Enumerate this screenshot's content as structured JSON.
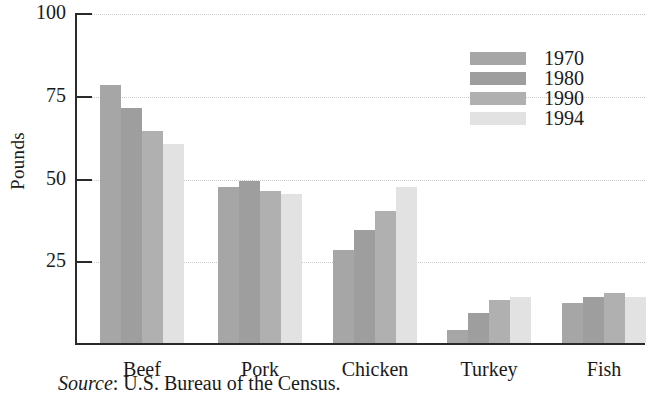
{
  "chart_data": {
    "type": "bar",
    "title": "",
    "xlabel": "",
    "ylabel": "Pounds",
    "ylim": [
      0,
      100
    ],
    "yticks": [
      25,
      50,
      75,
      100
    ],
    "ytick_labels": [
      "25",
      "50",
      "75",
      "100"
    ],
    "grid": true,
    "legend_position": "top-right",
    "categories": [
      "Beef",
      "Pork",
      "Chicken",
      "Turkey",
      "Fish"
    ],
    "series": [
      {
        "name": "1970",
        "color": "#a6a6a6",
        "values": [
          78,
          47,
          28,
          4,
          12
        ]
      },
      {
        "name": "1980",
        "color": "#9e9e9e",
        "values": [
          71,
          49,
          34,
          9,
          14
        ]
      },
      {
        "name": "1990",
        "color": "#b0b0b0",
        "values": [
          64,
          46,
          40,
          13,
          15
        ]
      },
      {
        "name": "1994",
        "color": "#e2e2e2",
        "values": [
          60,
          45,
          47,
          14,
          14
        ]
      }
    ],
    "annotations": {
      "source_prefix": "Source",
      "source_separator": ": ",
      "source_text": "U.S. Bureau of the Census."
    }
  },
  "axis": {
    "line_color": "#2a2a2a",
    "grid_color": "#c9c9c9"
  }
}
